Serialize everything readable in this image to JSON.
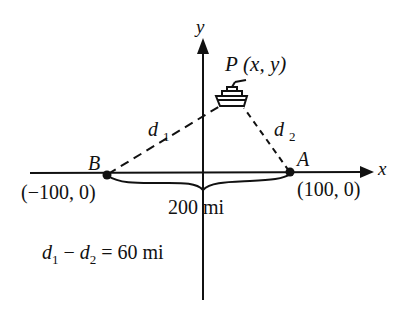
{
  "diagram": {
    "axes": {
      "x_label": "x",
      "y_label": "y"
    },
    "point_P": {
      "name": "P",
      "coords": "(x, y)"
    },
    "point_A": {
      "name": "A",
      "coords": "(100, 0)"
    },
    "point_B": {
      "name": "B",
      "coords": "(−100, 0)"
    },
    "distance_labels": {
      "d1_base": "d",
      "d1_sub": "1",
      "d2_base": "d",
      "d2_sub": "2"
    },
    "span_label": "200 mi",
    "equation": {
      "d1_base": "d",
      "d1_sub": "1",
      "minus": " − ",
      "d2_base": "d",
      "d2_sub": "2",
      "rhs": " = 60 mi"
    },
    "icons": {
      "ship": "ship-icon"
    },
    "colors": {
      "ink": "#111111",
      "background": "#ffffff"
    }
  }
}
